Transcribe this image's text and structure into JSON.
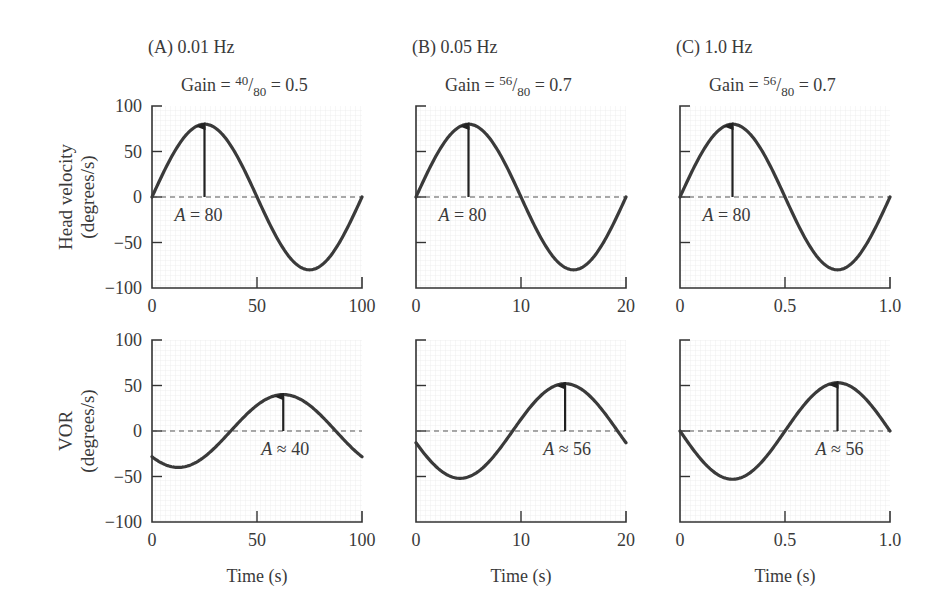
{
  "chart_data": [
    {
      "type": "line",
      "panel": "A",
      "title": "(A)  0.01 Hz",
      "gain": {
        "prefix": "Gain = ",
        "num": "40",
        "den": "80",
        "suffix": " = 0.5"
      },
      "x": {
        "min": 0,
        "max": 100,
        "ticks": [
          0,
          50,
          100
        ],
        "tick_labels": [
          "0",
          "50",
          "100"
        ],
        "label": "Time (s)"
      },
      "top": {
        "ylabel": [
          "Head velocity",
          "(degrees/s)"
        ],
        "ylim": [
          -100,
          100
        ],
        "yticks": [
          100,
          50,
          0,
          -50,
          -100
        ],
        "ytick_labels": [
          "100",
          "50",
          "0",
          "−50",
          "−100"
        ],
        "series": {
          "name": "Head velocity",
          "amplitude": 80,
          "period": 100,
          "phase_shift": 0,
          "sign": 1
        },
        "annotation": {
          "text_italic": "A",
          "text": " = 80",
          "arrow_x": 25,
          "arrow_to": 80
        }
      },
      "bottom": {
        "ylabel": [
          "VOR",
          "(degrees/s)"
        ],
        "ylim": [
          -100,
          100
        ],
        "yticks": [
          100,
          50,
          0,
          -50,
          -100
        ],
        "ytick_labels": [
          "100",
          "50",
          "0",
          "−50",
          "−100"
        ],
        "series": {
          "name": "VOR",
          "amplitude": 40,
          "period": 100,
          "phase_shift": 37.5,
          "sign": 1
        },
        "annotation": {
          "text_italic": "A",
          "text": " ≈ 40",
          "arrow_x": 62.5,
          "arrow_to": 40
        }
      }
    },
    {
      "type": "line",
      "panel": "B",
      "title": "(B)  0.05 Hz",
      "gain": {
        "prefix": "Gain = ",
        "num": "56",
        "den": "80",
        "suffix": " = 0.7"
      },
      "x": {
        "min": 0,
        "max": 20,
        "ticks": [
          0,
          10,
          20
        ],
        "tick_labels": [
          "0",
          "10",
          "20"
        ],
        "label": "Time (s)"
      },
      "top": {
        "ylim": [
          -100,
          100
        ],
        "yticks": [
          100,
          50,
          0,
          -50,
          -100
        ],
        "series": {
          "name": "Head velocity",
          "amplitude": 80,
          "period": 20,
          "phase_shift": 0,
          "sign": 1
        },
        "annotation": {
          "text_italic": "A",
          "text": " = 80",
          "arrow_x": 5,
          "arrow_to": 80
        }
      },
      "bottom": {
        "ylim": [
          -100,
          100
        ],
        "yticks": [
          100,
          50,
          0,
          -50,
          -100
        ],
        "series": {
          "name": "VOR",
          "amplitude": 52,
          "period": 20,
          "phase_shift": 9.2,
          "sign": 1
        },
        "annotation": {
          "text_italic": "A",
          "text": " ≈ 56",
          "arrow_x": 14.2,
          "arrow_to": 52
        }
      }
    },
    {
      "type": "line",
      "panel": "C",
      "title": "(C)  1.0 Hz",
      "gain": {
        "prefix": "Gain = ",
        "num": "56",
        "den": "80",
        "suffix": " = 0.7"
      },
      "x": {
        "min": 0,
        "max": 1.0,
        "ticks": [
          0,
          0.5,
          1.0
        ],
        "tick_labels": [
          "0",
          "0.5",
          "1.0"
        ],
        "label": "Time (s)"
      },
      "top": {
        "ylim": [
          -100,
          100
        ],
        "yticks": [
          100,
          50,
          0,
          -50,
          -100
        ],
        "series": {
          "name": "Head velocity",
          "amplitude": 80,
          "period": 1.0,
          "phase_shift": 0,
          "sign": 1
        },
        "annotation": {
          "text_italic": "A",
          "text": " = 80",
          "arrow_x": 0.25,
          "arrow_to": 80
        }
      },
      "bottom": {
        "ylim": [
          -100,
          100
        ],
        "yticks": [
          100,
          50,
          0,
          -50,
          -100
        ],
        "series": {
          "name": "VOR",
          "amplitude": 53,
          "period": 1.0,
          "phase_shift": 0.5,
          "sign": 1
        },
        "annotation": {
          "text_italic": "A",
          "text": " ≈ 56",
          "arrow_x": 0.75,
          "arrow_to": 53
        }
      }
    }
  ],
  "style": {
    "curve_color": "#3a3a3a",
    "axis_color": "#333333",
    "grid_color": "#ececec",
    "dash_color": "#555555"
  }
}
